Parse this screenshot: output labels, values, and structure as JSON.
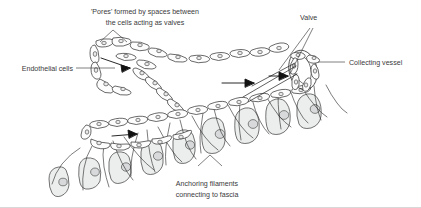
{
  "figure": {
    "background_color": "#ffffff",
    "ink_color": "#2b2b2b",
    "label_color": "#3a3a3c",
    "tissue_fill": "#eceded"
  },
  "labels": {
    "pores_line1": "'Pores' formed by spaces between",
    "pores_line2": "the cells acting as valves",
    "endothelial": "Endothelial cells",
    "valve": "Valve",
    "collecting": "Collecting vessel",
    "anchoring_line1": "Anchoring filaments",
    "anchoring_line2": "connecting to fascia"
  },
  "icons": {
    "flow_arrow": "flow-arrow-icon",
    "leader_line": "leader-line-icon",
    "pointer_v": "v-pointer-icon"
  },
  "structures": {
    "endothelial_cell_count": 46,
    "tissue_cell_count": 13,
    "flow_arrow_count": 3,
    "anchoring_filament_count": 22
  }
}
